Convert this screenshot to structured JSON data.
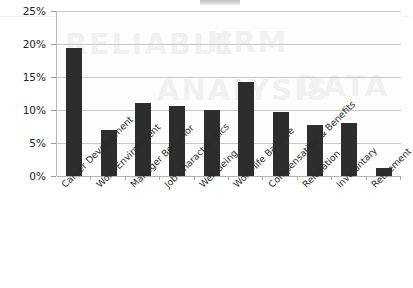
{
  "chart_data": {
    "type": "bar",
    "title": "",
    "xlabel": "",
    "ylabel": "",
    "ylim": [
      0,
      25
    ],
    "ytick_labels": [
      "25%",
      "20%",
      "15%",
      "10%",
      "5%",
      "0%"
    ],
    "ytick_values": [
      25,
      20,
      15,
      10,
      5,
      0
    ],
    "grid": true,
    "legend": "none",
    "bar_color": "#2d2d2d",
    "categories": [
      "Career Development",
      "Work Environment",
      "Manager Behavior",
      "Job Characteristics",
      "Well-Being",
      "Work-life Balance",
      "Compensation & Benefits",
      "Relocation",
      "Involuntary",
      "Retirement"
    ],
    "values": [
      19.4,
      7.0,
      11.1,
      10.6,
      10.0,
      14.2,
      9.7,
      7.8,
      8.0,
      1.2
    ]
  },
  "chart": {
    "background_color": "#fdfdfd",
    "gridline_color": "#c9c9c9",
    "axis_color": "#b9b9b9"
  }
}
